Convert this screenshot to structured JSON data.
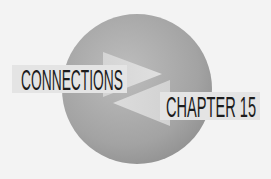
{
  "graphic": {
    "type": "chapter-connections-icon",
    "icon": "circle-with-crossing-arrows-icon",
    "colors": {
      "background": "#f3f3f3",
      "circle_light": "#b9b9b9",
      "circle_dark": "#8f8f8f",
      "arrow": "#dcdcdc",
      "label_bg": "#e4e4e4",
      "text": "#1c1c1c"
    }
  },
  "labels": {
    "connections": "CONNECTIONS",
    "chapter": "CHAPTER 15"
  }
}
